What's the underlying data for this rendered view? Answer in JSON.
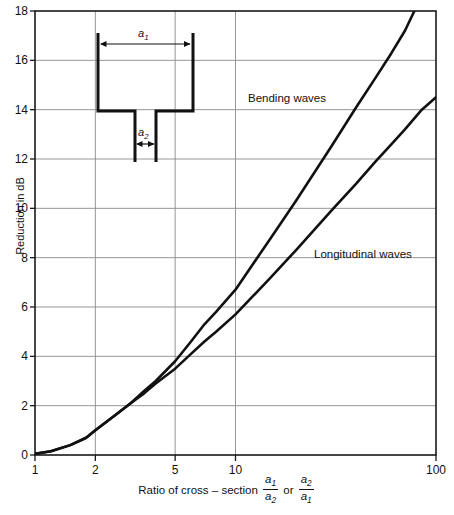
{
  "chart_data": {
    "type": "line",
    "title": "",
    "xlabel": "Ratio of cross – section a1/a2 or a2/a1",
    "ylabel": "Reduction in dB",
    "xscale": "log",
    "xlim": [
      1,
      100
    ],
    "ylim": [
      0,
      18
    ],
    "xticks": [
      1,
      2,
      5,
      10,
      100
    ],
    "xtick_labels": [
      "1",
      "2",
      "5",
      "10",
      "100"
    ],
    "yticks": [
      0,
      2,
      4,
      6,
      8,
      10,
      12,
      14,
      16,
      18
    ],
    "ytick_labels": [
      "0",
      "2",
      "4",
      "6",
      "8",
      "10",
      "12",
      "14",
      "16",
      "18"
    ],
    "grid": true,
    "legend_position": "inline-annotations",
    "series": [
      {
        "name": "Bending waves",
        "points": [
          [
            1.0,
            0.05
          ],
          [
            1.2,
            0.15
          ],
          [
            1.5,
            0.4
          ],
          [
            1.8,
            0.7
          ],
          [
            2.0,
            1.0
          ],
          [
            2.5,
            1.6
          ],
          [
            3.0,
            2.1
          ],
          [
            3.5,
            2.6
          ],
          [
            4.0,
            3.0
          ],
          [
            5.0,
            3.8
          ],
          [
            6.0,
            4.6
          ],
          [
            7.0,
            5.3
          ],
          [
            8.0,
            5.8
          ],
          [
            10.0,
            6.7
          ],
          [
            15.0,
            8.8
          ],
          [
            20.0,
            10.3
          ],
          [
            30.0,
            12.5
          ],
          [
            40.0,
            14.1
          ],
          [
            50.0,
            15.3
          ],
          [
            60.0,
            16.3
          ],
          [
            70.0,
            17.2
          ],
          [
            78.0,
            18.0
          ]
        ]
      },
      {
        "name": "Longitudinal waves",
        "points": [
          [
            1.0,
            0.05
          ],
          [
            1.2,
            0.15
          ],
          [
            1.5,
            0.4
          ],
          [
            1.8,
            0.7
          ],
          [
            2.0,
            1.0
          ],
          [
            2.5,
            1.6
          ],
          [
            3.0,
            2.1
          ],
          [
            3.5,
            2.5
          ],
          [
            4.0,
            2.9
          ],
          [
            5.0,
            3.5
          ],
          [
            6.0,
            4.1
          ],
          [
            7.0,
            4.6
          ],
          [
            8.0,
            5.0
          ],
          [
            10.0,
            5.7
          ],
          [
            15.0,
            7.2
          ],
          [
            20.0,
            8.3
          ],
          [
            30.0,
            9.9
          ],
          [
            40.0,
            11.0
          ],
          [
            50.0,
            11.9
          ],
          [
            60.0,
            12.6
          ],
          [
            70.0,
            13.2
          ],
          [
            85.0,
            14.0
          ],
          [
            100.0,
            14.5
          ]
        ]
      }
    ],
    "annotations": [
      {
        "text": "Bending waves",
        "x_px": 248,
        "y_px": 92
      },
      {
        "text": "Longitudinal waves",
        "x_px": 314,
        "y_px": 248
      }
    ]
  },
  "inset": {
    "name": "duct-cross-section-diagram",
    "wide_dimension_label": "a",
    "wide_dimension_sub": "1",
    "narrow_dimension_label": "a",
    "narrow_dimension_sub": "2"
  },
  "axis_label_parts": {
    "prefix": "Ratio of cross – section",
    "frac1_num": "a1",
    "frac1_den": "a2",
    "conjunction": "or",
    "frac2_num": "a2",
    "frac2_den": "a1"
  }
}
